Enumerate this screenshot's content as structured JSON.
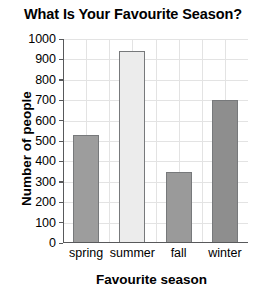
{
  "chart_data": {
    "type": "bar",
    "title": "What Is Your Favourite Season?",
    "xlabel": "Favourite season",
    "ylabel": "Number of people",
    "categories": [
      "spring",
      "summer",
      "fall",
      "winter"
    ],
    "values": [
      530,
      940,
      350,
      700
    ],
    "bar_colors": [
      "#9d9d9d",
      "#ececec",
      "#9a9a9a",
      "#8e8e8e"
    ],
    "bar_border_color": "#77797b",
    "ylim": [
      0,
      1000
    ],
    "ytick_labels": [
      "1000",
      "900",
      "800",
      "700",
      "600",
      "500",
      "400",
      "300",
      "200",
      "100",
      "0"
    ],
    "ytick_values": [
      1000,
      900,
      800,
      700,
      600,
      500,
      400,
      300,
      200,
      100,
      0
    ],
    "grid": true,
    "legend": false
  }
}
